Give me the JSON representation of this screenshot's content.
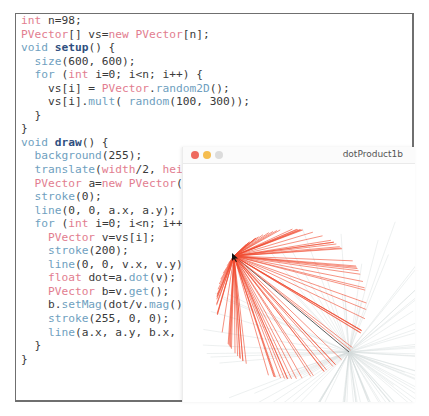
{
  "editor": {
    "lines": [
      [
        {
          "t": "int",
          "c": "k"
        },
        {
          "t": " n=98;",
          "c": ""
        }
      ],
      [
        {
          "t": "PVector",
          "c": "k"
        },
        {
          "t": "[] vs=",
          "c": ""
        },
        {
          "t": "new",
          "c": "k"
        },
        {
          "t": " ",
          "c": ""
        },
        {
          "t": "PVector",
          "c": "k"
        },
        {
          "t": "[n];",
          "c": ""
        }
      ],
      [
        {
          "t": "void",
          "c": "f"
        },
        {
          "t": " ",
          "c": ""
        },
        {
          "t": "setup",
          "c": "b"
        },
        {
          "t": "() {",
          "c": ""
        }
      ],
      [
        {
          "t": "  ",
          "c": ""
        },
        {
          "t": "size",
          "c": "f"
        },
        {
          "t": "(600, 600);",
          "c": ""
        }
      ],
      [
        {
          "t": "  ",
          "c": ""
        },
        {
          "t": "for",
          "c": "f"
        },
        {
          "t": " (",
          "c": ""
        },
        {
          "t": "int",
          "c": "k"
        },
        {
          "t": " i=0; i<n; i++) {",
          "c": ""
        }
      ],
      [
        {
          "t": "    vs[i] = ",
          "c": ""
        },
        {
          "t": "PVector",
          "c": "k"
        },
        {
          "t": ".",
          "c": ""
        },
        {
          "t": "random2D",
          "c": "f"
        },
        {
          "t": "();",
          "c": ""
        }
      ],
      [
        {
          "t": "    vs[i].",
          "c": ""
        },
        {
          "t": "mult",
          "c": "f"
        },
        {
          "t": "( ",
          "c": ""
        },
        {
          "t": "random",
          "c": "f"
        },
        {
          "t": "(100, 300));",
          "c": ""
        }
      ],
      [
        {
          "t": "  }",
          "c": ""
        }
      ],
      [
        {
          "t": "}",
          "c": ""
        }
      ],
      [
        {
          "t": "void",
          "c": "f"
        },
        {
          "t": " ",
          "c": ""
        },
        {
          "t": "draw",
          "c": "b"
        },
        {
          "t": "() {",
          "c": ""
        }
      ],
      [
        {
          "t": "  ",
          "c": ""
        },
        {
          "t": "background",
          "c": "f"
        },
        {
          "t": "(255);",
          "c": ""
        }
      ],
      [
        {
          "t": "  ",
          "c": ""
        },
        {
          "t": "translate",
          "c": "f"
        },
        {
          "t": "(",
          "c": ""
        },
        {
          "t": "width",
          "c": "k"
        },
        {
          "t": "/2, ",
          "c": ""
        },
        {
          "t": "height",
          "c": "k"
        },
        {
          "t": "/2);",
          "c": ""
        }
      ],
      [
        {
          "t": "  ",
          "c": ""
        },
        {
          "t": "PVector",
          "c": "k"
        },
        {
          "t": " a=",
          "c": ""
        },
        {
          "t": "new",
          "c": "k"
        },
        {
          "t": " ",
          "c": ""
        },
        {
          "t": "PVector",
          "c": "k"
        },
        {
          "t": "(",
          "c": ""
        },
        {
          "t": "mouseX",
          "c": "k"
        },
        {
          "t": "-",
          "c": ""
        },
        {
          "t": "width",
          "c": "k"
        },
        {
          "t": "/2, ",
          "c": ""
        },
        {
          "t": "mouseY",
          "c": "k"
        },
        {
          "t": "-",
          "c": ""
        },
        {
          "t": "height",
          "c": "k"
        },
        {
          "t": "/2);",
          "c": ""
        }
      ],
      [
        {
          "t": "  ",
          "c": ""
        },
        {
          "t": "stroke",
          "c": "f"
        },
        {
          "t": "(0);",
          "c": ""
        }
      ],
      [
        {
          "t": "  ",
          "c": ""
        },
        {
          "t": "line",
          "c": "f"
        },
        {
          "t": "(0, 0, a.x, a.y);",
          "c": ""
        }
      ],
      [
        {
          "t": "  ",
          "c": ""
        },
        {
          "t": "for",
          "c": "f"
        },
        {
          "t": " (",
          "c": ""
        },
        {
          "t": "int",
          "c": "k"
        },
        {
          "t": " i=0; i<n; i++) {",
          "c": ""
        }
      ],
      [
        {
          "t": "    ",
          "c": ""
        },
        {
          "t": "PVector",
          "c": "k"
        },
        {
          "t": " v=vs[i];",
          "c": ""
        }
      ],
      [
        {
          "t": "    ",
          "c": ""
        },
        {
          "t": "stroke",
          "c": "f"
        },
        {
          "t": "(200);",
          "c": ""
        }
      ],
      [
        {
          "t": "    ",
          "c": ""
        },
        {
          "t": "line",
          "c": "f"
        },
        {
          "t": "(0, 0, v.x, v.y);",
          "c": ""
        }
      ],
      [
        {
          "t": "    ",
          "c": ""
        },
        {
          "t": "float",
          "c": "k"
        },
        {
          "t": " dot=a.",
          "c": ""
        },
        {
          "t": "dot",
          "c": "f"
        },
        {
          "t": "(v);",
          "c": ""
        }
      ],
      [
        {
          "t": "    ",
          "c": ""
        },
        {
          "t": "PVector",
          "c": "k"
        },
        {
          "t": " b=v.",
          "c": ""
        },
        {
          "t": "get",
          "c": "f"
        },
        {
          "t": "();",
          "c": ""
        }
      ],
      [
        {
          "t": "    b.",
          "c": ""
        },
        {
          "t": "setMag",
          "c": "f"
        },
        {
          "t": "(dot/v.",
          "c": ""
        },
        {
          "t": "mag",
          "c": "f"
        },
        {
          "t": "());",
          "c": ""
        }
      ],
      [
        {
          "t": "    ",
          "c": ""
        },
        {
          "t": "stroke",
          "c": "f"
        },
        {
          "t": "(255, 0, 0);",
          "c": ""
        }
      ],
      [
        {
          "t": "    ",
          "c": ""
        },
        {
          "t": "line",
          "c": "f"
        },
        {
          "t": "(a.x, a.y, b.x, b.y);",
          "c": ""
        }
      ],
      [
        {
          "t": "  }",
          "c": ""
        }
      ],
      [
        {
          "t": "}",
          "c": ""
        }
      ]
    ]
  },
  "sketch_window": {
    "title": "dotProduct1b",
    "traffic_lights": {
      "close": "#ee6a5f",
      "minimize": "#f5bd4f",
      "zoom": "#dcdcdc"
    },
    "origin": {
      "x": 166,
      "y": 188
    },
    "mouse_vector": {
      "x": -115,
      "y": -96
    },
    "vector_count": 98,
    "seed": 98,
    "colors": {
      "red": "#f04a2f",
      "gray": "#d4dcdc",
      "axis": "#333333"
    }
  }
}
